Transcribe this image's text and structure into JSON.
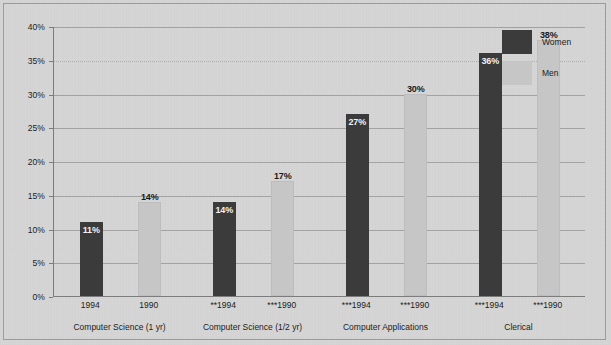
{
  "chart_data": {
    "type": "bar",
    "title": "",
    "subtitle": "",
    "xlabel": "",
    "ylabel": "",
    "ylim": [
      0,
      40
    ],
    "ytick_values": [
      0,
      5,
      10,
      15,
      20,
      25,
      30,
      35,
      40
    ],
    "ytick_labels": [
      "0%",
      "5%",
      "10%",
      "15%",
      "20%",
      "25%",
      "30%",
      "35%",
      "40%"
    ],
    "grid": true,
    "legend_position": "top-right",
    "categories": [
      "1994",
      "1990",
      "**1994",
      "***1990",
      "***1994",
      "***1990",
      "***1994",
      "***1990"
    ],
    "series": [
      {
        "name": "Women",
        "color": "#3b3b3b",
        "values": [
          11,
          14,
          27,
          36,
          2,
          1,
          24,
          16
        ]
      },
      {
        "name": "Men",
        "color": "#c6c6c6",
        "values": [
          14,
          17,
          30,
          38,
          6,
          2,
          17,
          8
        ]
      }
    ],
    "value_labels": [
      {
        "text": "11%"
      },
      {
        "text": "14%"
      },
      {
        "text": "14%"
      },
      {
        "text": "17%"
      },
      {
        "text": "27%"
      },
      {
        "text": "30%"
      },
      {
        "text": "36%"
      },
      {
        "text": "38%"
      },
      {
        "text": "2%"
      },
      {
        "text": "6%"
      },
      {
        "text": "1%"
      },
      {
        "text": "2%"
      },
      {
        "text": "24%"
      },
      {
        "text": "17%"
      },
      {
        "text": "16%"
      },
      {
        "text": "8%"
      }
    ],
    "groups": [
      {
        "label": "Computer Science (1 yr)",
        "ticks": [
          "1994",
          "1990"
        ]
      },
      {
        "label": "Computer Science (1/2 yr)",
        "ticks": [
          "**1994",
          "***1990"
        ]
      },
      {
        "label": "Computer Applications",
        "ticks": [
          "***1994",
          "***1990"
        ]
      },
      {
        "label": "Clerical",
        "ticks": [
          "***1994",
          "***1990"
        ]
      }
    ]
  },
  "legend": {
    "items": [
      {
        "label": "Women",
        "color": "#3b3b3b"
      },
      {
        "label": "Men",
        "color": "#c6c6c6"
      }
    ]
  },
  "axis": {
    "y_labels": [
      "40%",
      "35%",
      "30%",
      "25%",
      "20%",
      "15%",
      "10%",
      "5%",
      "0%"
    ]
  },
  "x_axis": {
    "tick_labels": [
      "1994",
      "1990",
      "**1994",
      "***1990",
      "***1994",
      "***1990",
      "***1994",
      "***1990"
    ],
    "group_labels": [
      "Computer Science (1 yr)",
      "Computer Science (1/2 yr)",
      "Computer Applications",
      "Clerical"
    ]
  },
  "colors": {
    "women_bar": "#3b3b3b",
    "men_bar": "#c6c6c6",
    "background": "#d6d6d6",
    "axis": "#7c7c7c",
    "gridline": "#a2a2a2",
    "text": "#1c1c1c"
  }
}
